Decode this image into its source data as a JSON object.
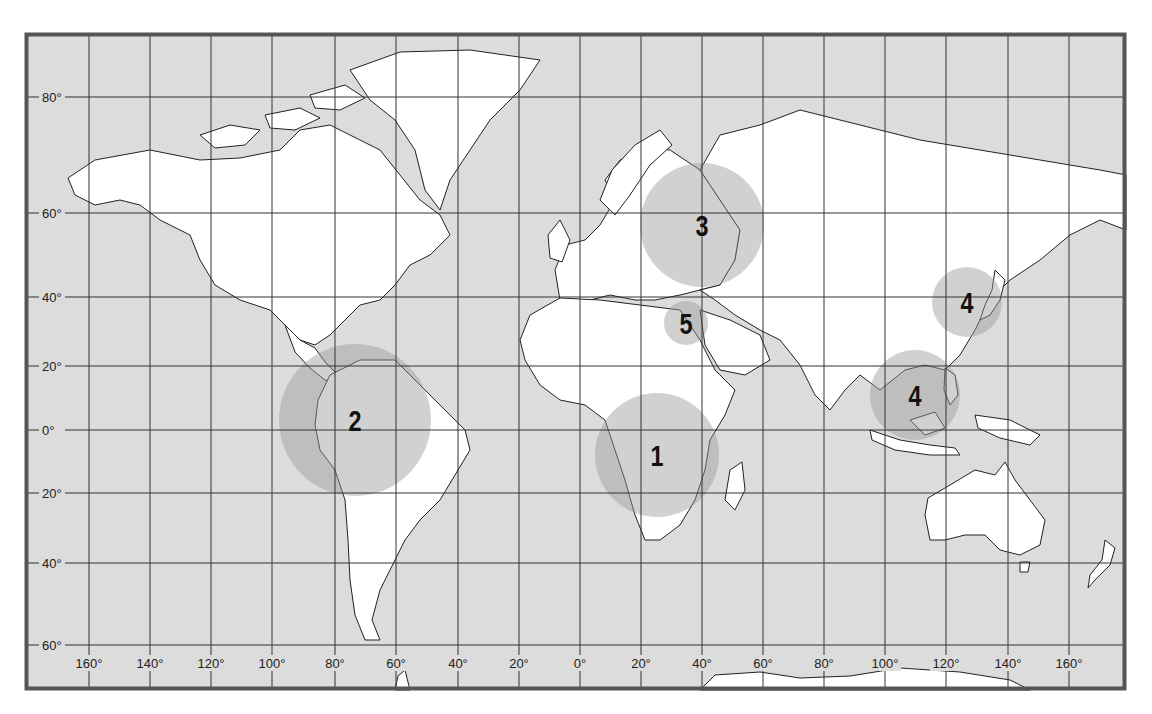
{
  "map": {
    "frame": {
      "x": 25,
      "y": 33,
      "width": 1101,
      "height": 657,
      "border_color": "#555555",
      "ocean_color": "#dcdcdc",
      "land_color": "#ffffff",
      "grid_color": "#333333",
      "highlight_color": "#9a9a9a"
    },
    "latitudes": [
      {
        "label": "80°",
        "y": 97
      },
      {
        "label": "60°",
        "y": 213
      },
      {
        "label": "40°",
        "y": 297
      },
      {
        "label": "20°",
        "y": 366
      },
      {
        "label": "0°",
        "y": 430
      },
      {
        "label": "20°",
        "y": 493
      },
      {
        "label": "40°",
        "y": 563
      },
      {
        "label": "60°",
        "y": 645
      }
    ],
    "longitudes": [
      {
        "label": "160°",
        "x": 89
      },
      {
        "label": "140°",
        "x": 150
      },
      {
        "label": "120°",
        "x": 211
      },
      {
        "label": "100°",
        "x": 272
      },
      {
        "label": "80°",
        "x": 335
      },
      {
        "label": "60°",
        "x": 396
      },
      {
        "label": "40°",
        "x": 458
      },
      {
        "label": "20°",
        "x": 519
      },
      {
        "label": "0°",
        "x": 580
      },
      {
        "label": "20°",
        "x": 641
      },
      {
        "label": "40°",
        "x": 702
      },
      {
        "label": "60°",
        "x": 763
      },
      {
        "label": "80°",
        "x": 824
      },
      {
        "label": "100°",
        "x": 885
      },
      {
        "label": "120°",
        "x": 946
      },
      {
        "label": "140°",
        "x": 1008
      },
      {
        "label": "160°",
        "x": 1069
      }
    ],
    "regions": [
      {
        "number": "1",
        "name": "Central Africa",
        "cx": 657,
        "cy": 455,
        "r": 62
      },
      {
        "number": "2",
        "name": "Northern South America",
        "cx": 355,
        "cy": 420,
        "r": 76
      },
      {
        "number": "3",
        "name": "Eastern Europe / Western Russia",
        "cx": 702,
        "cy": 225,
        "r": 62
      },
      {
        "number": "4",
        "name": "Korea / Japan",
        "cx": 967,
        "cy": 302,
        "r": 35
      },
      {
        "number": "4",
        "name": "Southeast Asia",
        "cx": 915,
        "cy": 395,
        "r": 45
      },
      {
        "number": "5",
        "name": "Eastern Mediterranean",
        "cx": 686,
        "cy": 323,
        "r": 22
      }
    ]
  }
}
